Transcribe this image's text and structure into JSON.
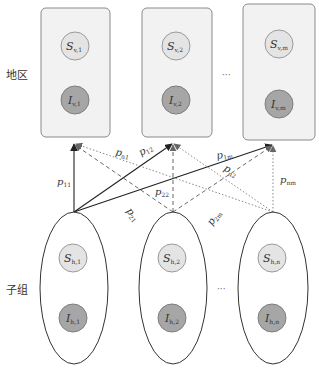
{
  "labels": {
    "region_row": "地区",
    "subgroup_row": "子组",
    "ellipsis_top": "···",
    "ellipsis_bottom": "···"
  },
  "regions": [
    {
      "s_base": "S",
      "s_sub": "v,1",
      "i_base": "I",
      "i_sub": "v,1"
    },
    {
      "s_base": "S",
      "s_sub": "v,2",
      "i_base": "I",
      "i_sub": "v,2"
    },
    {
      "s_base": "S",
      "s_sub": "v,m",
      "i_base": "I",
      "i_sub": "v,m"
    }
  ],
  "subgroups": [
    {
      "s_base": "S",
      "s_sub": "h,1",
      "i_base": "I",
      "i_sub": "h,1"
    },
    {
      "s_base": "S",
      "s_sub": "h,2",
      "i_base": "I",
      "i_sub": "h,2"
    },
    {
      "s_base": "S",
      "s_sub": "h,n",
      "i_base": "I",
      "i_sub": "h,n"
    }
  ],
  "edges": [
    {
      "base": "p",
      "sub": "11",
      "from": "h1",
      "to": "v1",
      "style": "solid"
    },
    {
      "base": "p",
      "sub": "12",
      "from": "h1",
      "to": "v2",
      "style": "solid"
    },
    {
      "base": "p",
      "sub": "1m",
      "from": "h1",
      "to": "v3",
      "style": "solid"
    },
    {
      "base": "p",
      "sub": "21",
      "from": "h2",
      "to": "v1",
      "style": "dashed"
    },
    {
      "base": "p",
      "sub": "22",
      "from": "h2",
      "to": "v2",
      "style": "dashed"
    },
    {
      "base": "p",
      "sub": "2m",
      "from": "h2",
      "to": "v3",
      "style": "dashed"
    },
    {
      "base": "p",
      "sub": "n1",
      "from": "h3",
      "to": "v1",
      "style": "dotted"
    },
    {
      "base": "p",
      "sub": "n2",
      "from": "h3",
      "to": "v2",
      "style": "dotted"
    },
    {
      "base": "p",
      "sub": "nm",
      "from": "h3",
      "to": "v3",
      "style": "dotted"
    }
  ],
  "colors": {
    "box_fill": "#f2f2f2",
    "box_stroke": "#8a8a8a",
    "s_fill": "#e4e4e4",
    "s_stroke": "#9a9a9a",
    "i_fill": "#a6a6a6",
    "i_stroke": "#7e7e7e",
    "line": "#222222"
  }
}
